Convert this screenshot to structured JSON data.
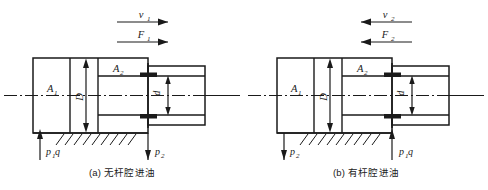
{
  "figure": {
    "background_color": "#ffffff",
    "line_color": "#1a1a1a",
    "title_absent": true
  },
  "panels": [
    {
      "id": "a",
      "caption": "(a) 无杆腔进油",
      "direction": "right",
      "labels": {
        "velocity": "v",
        "velocity_sub": "1",
        "force": "F",
        "force_sub": "1",
        "area_cap": "A",
        "area_cap_sub": "1",
        "area_rod": "A",
        "area_rod_sub": "2",
        "bore": "D",
        "rod": "d",
        "port_left": "p",
        "port_left_sub": "1",
        "port_left_extra": "q",
        "port_right": "p",
        "port_right_sub": "2"
      },
      "ports": {
        "left_flow": "in",
        "right_flow": "out"
      }
    },
    {
      "id": "b",
      "caption": "(b) 有杆腔进油",
      "direction": "left",
      "labels": {
        "velocity": "v",
        "velocity_sub": "2",
        "force": "F",
        "force_sub": "2",
        "area_cap": "A",
        "area_cap_sub": "1",
        "area_rod": "A",
        "area_rod_sub": "2",
        "bore": "D",
        "rod": "d",
        "port_left": "p",
        "port_left_sub": "2",
        "port_left_extra": "",
        "port_right": "p",
        "port_right_sub": "1",
        "port_right_extra": "q"
      },
      "ports": {
        "left_flow": "out",
        "right_flow": "in"
      }
    }
  ]
}
